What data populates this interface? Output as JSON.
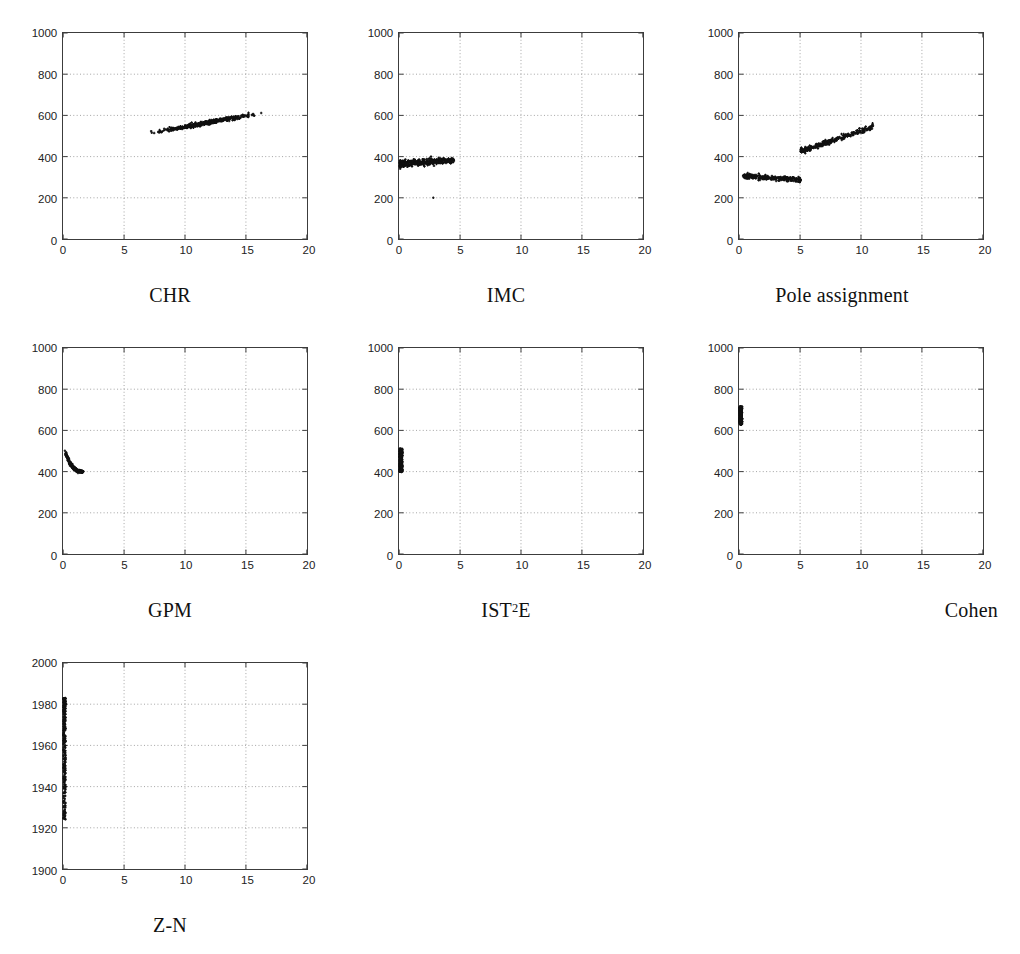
{
  "figure": {
    "background_color": "#ffffff",
    "axis_color": "#3c3c3c",
    "grid_color": "#8c8c8c",
    "point_color": "#101010",
    "marker": "plus",
    "layout": {
      "rows": 3,
      "columns": 3,
      "panel_order": [
        "CHR",
        "IMC",
        "Pole assignment",
        "GPM",
        "IST2E",
        "Cohen",
        "Z-N"
      ]
    }
  },
  "chart_data": [
    {
      "id": "chr",
      "type": "scatter",
      "title": "CHR",
      "caption": "CHR",
      "xlabel": "",
      "ylabel": "",
      "xlim": [
        0,
        20
      ],
      "ylim": [
        0,
        1000
      ],
      "xticks": [
        0,
        5,
        10,
        15,
        20
      ],
      "yticks": [
        0,
        200,
        400,
        600,
        800,
        1000
      ],
      "xtick_labels": [
        "0",
        "5",
        "10",
        "15",
        "20"
      ],
      "ytick_labels": [
        "0",
        "200",
        "400",
        "600",
        "800",
        "1000"
      ],
      "grid": true,
      "clusters": [
        {
          "shape": "band",
          "x_start": 6.2,
          "x_end": 17.1,
          "y_start": 505,
          "y_end": 620,
          "y_spread": 16,
          "n": 430,
          "density": "dense-mid"
        }
      ],
      "description": "Narrow rising band from about (6.2, 505) to (17, 620)."
    },
    {
      "id": "imc",
      "type": "scatter",
      "title": "IMC",
      "caption": "IMC",
      "xlabel": "",
      "ylabel": "",
      "xlim": [
        0,
        20
      ],
      "ylim": [
        0,
        1000
      ],
      "xticks": [
        0,
        5,
        10,
        15,
        20
      ],
      "yticks": [
        0,
        200,
        400,
        600,
        800,
        1000
      ],
      "xtick_labels": [
        "0",
        "5",
        "10",
        "15",
        "20"
      ],
      "ytick_labels": [
        "0",
        "200",
        "400",
        "600",
        "800",
        "1000"
      ],
      "grid": true,
      "clusters": [
        {
          "shape": "band",
          "x_start": 0.05,
          "x_end": 4.5,
          "y_start": 365,
          "y_end": 382,
          "y_spread": 26,
          "n": 400,
          "density": "dense-left"
        }
      ],
      "outliers": [
        {
          "x": 2.8,
          "y": 200
        }
      ],
      "description": "Flat horizontal band near y = 370 for x in [0, 4.5], plus a single outlier at (2.8, 200)."
    },
    {
      "id": "pole-assignment",
      "type": "scatter",
      "title": "Pole assignment",
      "caption": "Pole assignment",
      "xlabel": "",
      "ylabel": "",
      "xlim": [
        0,
        20
      ],
      "ylim": [
        0,
        1000
      ],
      "xticks": [
        0,
        5,
        10,
        15,
        20
      ],
      "yticks": [
        0,
        200,
        400,
        600,
        800,
        1000
      ],
      "xtick_labels": [
        "0",
        "5",
        "10",
        "15",
        "20"
      ],
      "ytick_labels": [
        "0",
        "200",
        "400",
        "600",
        "800",
        "1000"
      ],
      "grid": true,
      "clusters": [
        {
          "shape": "band",
          "x_start": 0.3,
          "x_end": 5.05,
          "y_start": 305,
          "y_end": 288,
          "y_spread": 20,
          "n": 260,
          "density": "uniform"
        },
        {
          "shape": "band",
          "x_start": 5.05,
          "x_end": 11.0,
          "y_start": 425,
          "y_end": 545,
          "y_spread": 22,
          "n": 300,
          "density": "dense-left"
        }
      ],
      "description": "Two clusters: a flat band near y = 295 for x in [0.3, 5], and a rising band from (5, 425) to (11, 545)."
    },
    {
      "id": "gpm",
      "type": "scatter",
      "title": "GPM",
      "caption": "GPM",
      "xlabel": "",
      "ylabel": "",
      "xlim": [
        0,
        20
      ],
      "ylim": [
        0,
        1000
      ],
      "xticks": [
        0,
        5,
        10,
        15,
        20
      ],
      "yticks": [
        0,
        200,
        400,
        600,
        800,
        1000
      ],
      "xtick_labels": [
        "0",
        "5",
        "10",
        "15",
        "20"
      ],
      "ytick_labels": [
        "0",
        "200",
        "400",
        "600",
        "800",
        "1000"
      ],
      "grid": true,
      "clusters": [
        {
          "shape": "hockey-stick",
          "x_start": 0.1,
          "x_end": 1.6,
          "y_start": 510,
          "y_end": 400,
          "y_spread": 14,
          "n": 340,
          "density": "dense-left"
        }
      ],
      "description": "L-shaped / hockey-stick cluster falling steeply from (0.1, 510) then flattening to (1.6, 400)."
    },
    {
      "id": "ist2e",
      "type": "scatter",
      "title": "IST2E",
      "caption": "IST²E",
      "caption_base": "IST",
      "caption_sup": "2",
      "caption_tail": "E",
      "xlabel": "",
      "ylabel": "",
      "xlim": [
        0,
        20
      ],
      "ylim": [
        0,
        1000
      ],
      "xticks": [
        0,
        5,
        10,
        15,
        20
      ],
      "yticks": [
        0,
        200,
        400,
        600,
        800,
        1000
      ],
      "xtick_labels": [
        "0",
        "5",
        "10",
        "15",
        "20"
      ],
      "ytick_labels": [
        "0",
        "200",
        "400",
        "600",
        "800",
        "1000"
      ],
      "grid": true,
      "clusters": [
        {
          "shape": "vertical",
          "x_start": 0.02,
          "x_end": 0.26,
          "y_start": 398,
          "y_end": 512,
          "y_spread": 0,
          "n": 300,
          "density": "uniform"
        }
      ],
      "description": "Narrow vertical cluster at x near 0.1 spanning y from about 400 to 510."
    },
    {
      "id": "cohen",
      "type": "scatter",
      "title": "Cohen",
      "caption": "Cohen",
      "caption_align": "right",
      "xlabel": "",
      "ylabel": "",
      "xlim": [
        0,
        20
      ],
      "ylim": [
        0,
        1000
      ],
      "xticks": [
        0,
        5,
        10,
        15,
        20
      ],
      "yticks": [
        0,
        200,
        400,
        600,
        800,
        1000
      ],
      "xtick_labels": [
        "0",
        "5",
        "10",
        "15",
        "20"
      ],
      "ytick_labels": [
        "0",
        "200",
        "400",
        "600",
        "800",
        "1000"
      ],
      "grid": true,
      "clusters": [
        {
          "shape": "vertical",
          "x_start": 0.02,
          "x_end": 0.24,
          "y_start": 628,
          "y_end": 716,
          "y_spread": 0,
          "n": 280,
          "density": "uniform"
        }
      ],
      "description": "Solid narrow vertical cluster at x near 0.1 spanning y from about 630 to 715."
    },
    {
      "id": "z-n",
      "type": "scatter",
      "title": "Z-N",
      "caption": "Z-N",
      "xlabel": "",
      "ylabel": "",
      "xlim": [
        0,
        20
      ],
      "ylim": [
        1900,
        2000
      ],
      "xticks": [
        0,
        5,
        10,
        15,
        20
      ],
      "yticks": [
        1900,
        1920,
        1940,
        1960,
        1980,
        2000
      ],
      "xtick_labels": [
        "0",
        "5",
        "10",
        "15",
        "20"
      ],
      "ytick_labels": [
        "1900",
        "1920",
        "1940",
        "1960",
        "1980",
        "2000"
      ],
      "grid": true,
      "clusters": [
        {
          "shape": "vertical",
          "x_start": 0.02,
          "x_end": 0.2,
          "y_start": 1924,
          "y_end": 1983,
          "y_spread": 0,
          "n": 300,
          "density": "top-heavy"
        }
      ],
      "description": "Narrow vertical cluster at x near 0 spanning y from about 1925 to 1983, denser toward the top."
    }
  ]
}
